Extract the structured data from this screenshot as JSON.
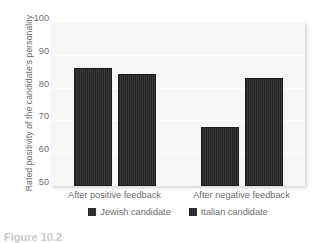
{
  "chart_data": {
    "type": "bar",
    "title": "",
    "xlabel": "",
    "ylabel": "Rated positivity of the candidate's personality",
    "ylim": [
      50,
      100
    ],
    "yticks": [
      100,
      90,
      80,
      70,
      60,
      50
    ],
    "grid": true,
    "legend_position": "bottom",
    "categories": [
      "After positive feedback",
      "After negative feedback"
    ],
    "series": [
      {
        "name": "Jewish candidate",
        "values": [
          86,
          68
        ],
        "color": "#2b2b2b"
      },
      {
        "name": "Italian candidate",
        "values": [
          84,
          83
        ],
        "color": "#2b2b2b"
      }
    ]
  },
  "caption": {
    "text": "Figure 10.2"
  }
}
